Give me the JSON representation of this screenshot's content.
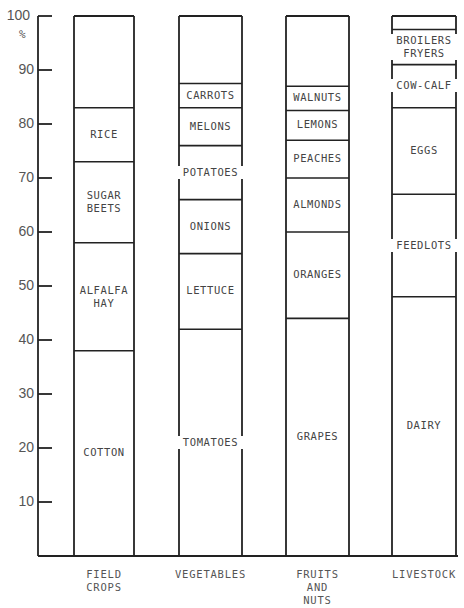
{
  "chart_data": {
    "type": "bar",
    "subtype": "stacked-100-percent",
    "title": "",
    "xlabel": "",
    "ylabel": "%",
    "ylim": [
      0,
      100
    ],
    "yticks": [
      10,
      20,
      30,
      40,
      50,
      60,
      70,
      80,
      90,
      100
    ],
    "grid": false,
    "legend": "none (segments labeled inline)",
    "categories": [
      "FIELD CROPS",
      "VEGETABLES",
      "FRUITS AND NUTS",
      "LIVESTOCK"
    ],
    "bars": [
      {
        "category": "FIELD CROPS",
        "segments": [
          {
            "label": "COTTON",
            "value": 38
          },
          {
            "label": "ALFALFA HAY",
            "value": 20
          },
          {
            "label": "SUGAR BEETS",
            "value": 15
          },
          {
            "label": "RICE",
            "value": 10
          },
          {
            "label": "",
            "value": 17
          }
        ]
      },
      {
        "category": "VEGETABLES",
        "segments": [
          {
            "label": "TOMATOES",
            "value": 42
          },
          {
            "label": "LETTUCE",
            "value": 14
          },
          {
            "label": "ONIONS",
            "value": 10
          },
          {
            "label": "POTATOES",
            "value": 10
          },
          {
            "label": "MELONS",
            "value": 7
          },
          {
            "label": "CARROTS",
            "value": 4.5
          },
          {
            "label": "",
            "value": 12.5
          }
        ]
      },
      {
        "category": "FRUITS AND NUTS",
        "segments": [
          {
            "label": "GRAPES",
            "value": 44
          },
          {
            "label": "ORANGES",
            "value": 16
          },
          {
            "label": "ALMONDS",
            "value": 10
          },
          {
            "label": "PEACHES",
            "value": 7
          },
          {
            "label": "LEMONS",
            "value": 5.5
          },
          {
            "label": "WALNUTS",
            "value": 4.5
          },
          {
            "label": "",
            "value": 13
          }
        ]
      },
      {
        "category": "LIVESTOCK",
        "segments": [
          {
            "label": "DAIRY",
            "value": 48
          },
          {
            "label": "FEEDLOTS",
            "value": 19
          },
          {
            "label": "EGGS",
            "value": 16
          },
          {
            "label": "COW-CALF",
            "value": 8
          },
          {
            "label": "BROILERS FRYERS",
            "value": 6.5
          },
          {
            "label": "",
            "value": 2.5
          }
        ]
      }
    ]
  },
  "axis": {
    "unit": "%",
    "ticks": [
      "10",
      "20",
      "30",
      "40",
      "50",
      "60",
      "70",
      "80",
      "90",
      "100"
    ]
  },
  "categories_display": [
    "FIELD\nCROPS",
    "VEGETABLES",
    "FRUITS\nAND\nNUTS",
    "LIVESTOCK"
  ],
  "style": {
    "line": "#222222",
    "text": "#444444",
    "background": "#ffffff"
  }
}
